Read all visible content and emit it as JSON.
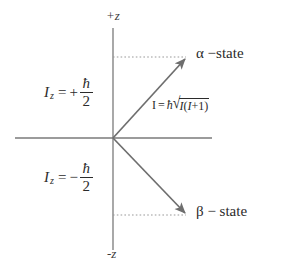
{
  "diagram": {
    "type": "vector-model-nuclear-spin",
    "title_text": "",
    "colors": {
      "axis": "#7a7a7a",
      "vector": "#6e6e6e",
      "dotted": "#9a9a9a",
      "text": "#2b2b2b",
      "background": "#ffffff"
    },
    "axes": {
      "positive_z_label": "+z",
      "negative_z_label": "-z",
      "vertical_axis_name": "z-axis",
      "horizontal_axis_name": "transverse-axis"
    },
    "states": {
      "alpha": {
        "label": "α −state",
        "iz_symbol": "I",
        "iz_subscript": "z",
        "iz_relation": "=",
        "iz_sign": "+",
        "iz_numerator": "ħ",
        "iz_denominator": "2"
      },
      "beta": {
        "label": "β − state",
        "iz_symbol": "I",
        "iz_subscript": "z",
        "iz_relation": "=",
        "iz_sign": "−",
        "iz_numerator": "ħ",
        "iz_denominator": "2"
      }
    },
    "magnitude": {
      "lhs": "I",
      "relation": "=",
      "hbar": "ħ",
      "radical_sign": "√",
      "radicand_first": "I",
      "radicand_open": "(",
      "radicand_second": "I",
      "radicand_plus": "+",
      "radicand_one": "1",
      "radicand_close": ")"
    }
  }
}
